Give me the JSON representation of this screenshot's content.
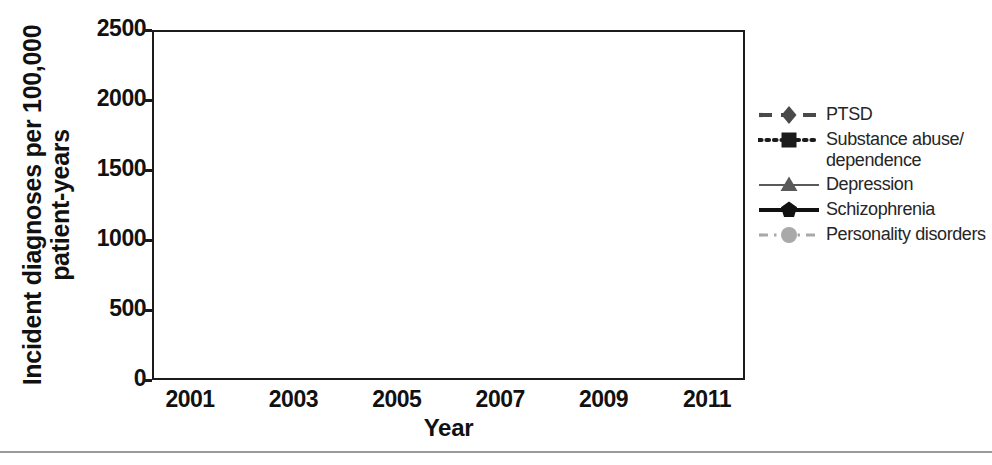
{
  "axes": {
    "ylabel_line1": "Incident diagnoses per 100,000",
    "ylabel_line2": "patient-years",
    "xlabel": "Year"
  },
  "chart_data": {
    "type": "line",
    "title": "",
    "xlabel": "Year",
    "ylabel": "Incident diagnoses per 100,000 patient-years",
    "categories": [
      "2001",
      "2003",
      "2005",
      "2007",
      "2009",
      "2011"
    ],
    "x": [
      2001,
      2003,
      2005,
      2007,
      2009,
      2011
    ],
    "ylim": [
      0,
      2500
    ],
    "yticks": [
      0,
      500,
      1000,
      1500,
      2000,
      2500
    ],
    "ytick_labels": [
      "0",
      "500",
      "1000",
      "1500",
      "2000",
      "2500"
    ],
    "grid": true,
    "legend_position": "right",
    "series": [
      {
        "name": "PTSD",
        "values": [
          185,
          185,
          570,
          870,
          1000,
          1115
        ],
        "marker": "diamond",
        "linestyle": "dashed",
        "color": "#4a4a4a"
      },
      {
        "name": "Substance abuse/\ndependence",
        "label_line1": "Substance abuse/",
        "label_line2": "dependence",
        "values": [
          450,
          310,
          350,
          440,
          565,
          490
        ],
        "marker": "square",
        "linestyle": "dotted",
        "color": "#1b1b1b"
      },
      {
        "name": "Depression",
        "values": [
          1450,
          1490,
          1780,
          2100,
          2325,
          2310
        ],
        "marker": "triangle",
        "linestyle": "solid-thin",
        "color": "#595959"
      },
      {
        "name": "Schizophrenia",
        "values": [
          40,
          35,
          33,
          36,
          32,
          30
        ],
        "marker": "pentagon",
        "linestyle": "solid-thick",
        "color": "#111111"
      },
      {
        "name": "Personality disorders",
        "values": [
          630,
          510,
          520,
          515,
          350,
          290
        ],
        "marker": "circle",
        "linestyle": "dashdot",
        "color": "#a9a9a9"
      }
    ]
  },
  "legend": {
    "items": [
      {
        "label": "PTSD"
      },
      {
        "label": "Substance abuse/"
      },
      {
        "label": "dependence"
      },
      {
        "label": "Depression"
      },
      {
        "label": "Schizophrenia"
      },
      {
        "label": "Personality disorders"
      }
    ]
  }
}
